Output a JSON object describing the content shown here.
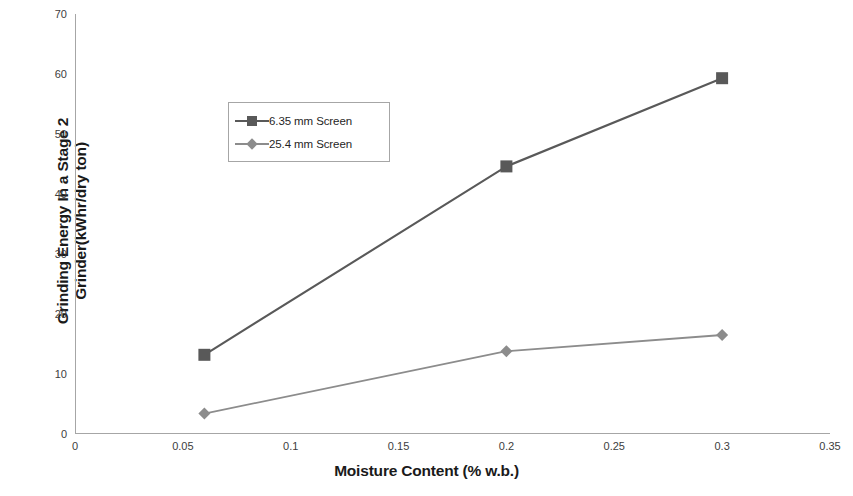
{
  "chart_data": {
    "type": "line",
    "title": "",
    "xlabel": "Moisture Content (% w.b.)",
    "ylabel_line1": "Grinding Energy In a Stage 2",
    "ylabel_line2": "Grinder(kWhr/dry ton)",
    "xlim": [
      0,
      0.35
    ],
    "ylim": [
      0,
      70
    ],
    "xticks": [
      "0",
      "0.05",
      "0.1",
      "0.15",
      "0.2",
      "0.25",
      "0.3",
      "0.35"
    ],
    "xtick_values": [
      0,
      0.05,
      0.1,
      0.15,
      0.2,
      0.25,
      0.3,
      0.35
    ],
    "yticks": [
      "0",
      "10",
      "20",
      "30",
      "40",
      "50",
      "60",
      "70"
    ],
    "ytick_values": [
      0,
      10,
      20,
      30,
      40,
      50,
      60,
      70
    ],
    "grid": false,
    "legend_position": "upper-left-inside",
    "x": [
      0.06,
      0.2,
      0.3
    ],
    "series": [
      {
        "name": "6.35 mm Screen",
        "marker": "square",
        "color": "#595959",
        "x": [
          0.06,
          0.2,
          0.3
        ],
        "values": [
          13.2,
          44.6,
          59.3
        ]
      },
      {
        "name": "25.4 mm Screen",
        "marker": "diamond",
        "color": "#8c8c8c",
        "x": [
          0.06,
          0.2,
          0.3
        ],
        "values": [
          3.4,
          13.8,
          16.5
        ]
      }
    ],
    "colors": {
      "series_1": "#595959",
      "series_2": "#8c8c8c",
      "axis": "#a6a6a6",
      "text": "#1a1a1a",
      "background": "#ffffff"
    }
  },
  "legend": {
    "items": [
      {
        "label": "6.35 mm Screen"
      },
      {
        "label": "25.4 mm Screen"
      }
    ]
  }
}
